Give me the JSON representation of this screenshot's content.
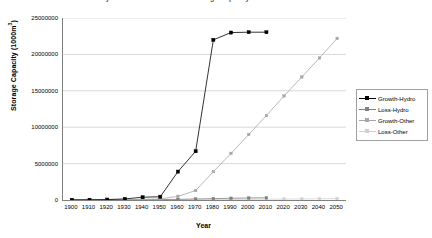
{
  "chart_data": {
    "type": "line",
    "title": "Hydro and Other Reservoir Storage Capacity",
    "xlabel": "Year",
    "ylabel": "Storage Capacity (1000m3)",
    "ylabel_base": "Storage Capacity (1000m",
    "ylabel_sup": "3",
    "ylabel_close": ")",
    "grid": "horizontal",
    "legend_position": "right",
    "ylim": [
      0,
      25000000
    ],
    "ytick_labels": [
      "25000000",
      "20000000",
      "15000000",
      "10000000",
      "5000000",
      "0"
    ],
    "ytick_values": [
      25000000,
      20000000,
      15000000,
      10000000,
      5000000,
      0
    ],
    "categories": [
      "1900",
      "1910",
      "1920",
      "1930",
      "1940",
      "1950",
      "1960",
      "1970",
      "1980",
      "1990",
      "2000",
      "2010",
      "2020",
      "2030",
      "2040",
      "2050"
    ],
    "series": [
      {
        "name": "Growth-Hydro",
        "color": "#000000",
        "marker": "square",
        "values": [
          20000,
          30000,
          60000,
          150000,
          380000,
          450000,
          3900000,
          6700000,
          22000000,
          23000000,
          23050000,
          23050000,
          null,
          null,
          null,
          null
        ]
      },
      {
        "name": "Loss-Hydro",
        "color": "#808080",
        "marker": "square",
        "values": [
          0,
          2000,
          5000,
          12000,
          30000,
          50000,
          90000,
          140000,
          190000,
          240000,
          280000,
          300000,
          null,
          null,
          null,
          null
        ]
      },
      {
        "name": "Growth-Other",
        "color": "#a6a6a6",
        "marker": "square",
        "values": [
          5000,
          10000,
          20000,
          45000,
          90000,
          150000,
          500000,
          1300000,
          3900000,
          6400000,
          9000000,
          11600000,
          14300000,
          16900000,
          19500000,
          22200000
        ]
      },
      {
        "name": "Loss-Other",
        "color": "#d0d0d0",
        "marker": "square",
        "values": [
          0,
          1000,
          2000,
          4000,
          8000,
          14000,
          22000,
          34000,
          50000,
          70000,
          90000,
          110000,
          130000,
          150000,
          170000,
          190000
        ]
      }
    ]
  },
  "legend": {
    "items": [
      {
        "label": "Growth-Hydro",
        "color": "#000000"
      },
      {
        "label": "Loss-Hydro",
        "color": "#808080"
      },
      {
        "label": "Growth-Other",
        "color": "#a6a6a6"
      },
      {
        "label": "Loss-Other",
        "color": "#d0d0d0"
      }
    ]
  }
}
